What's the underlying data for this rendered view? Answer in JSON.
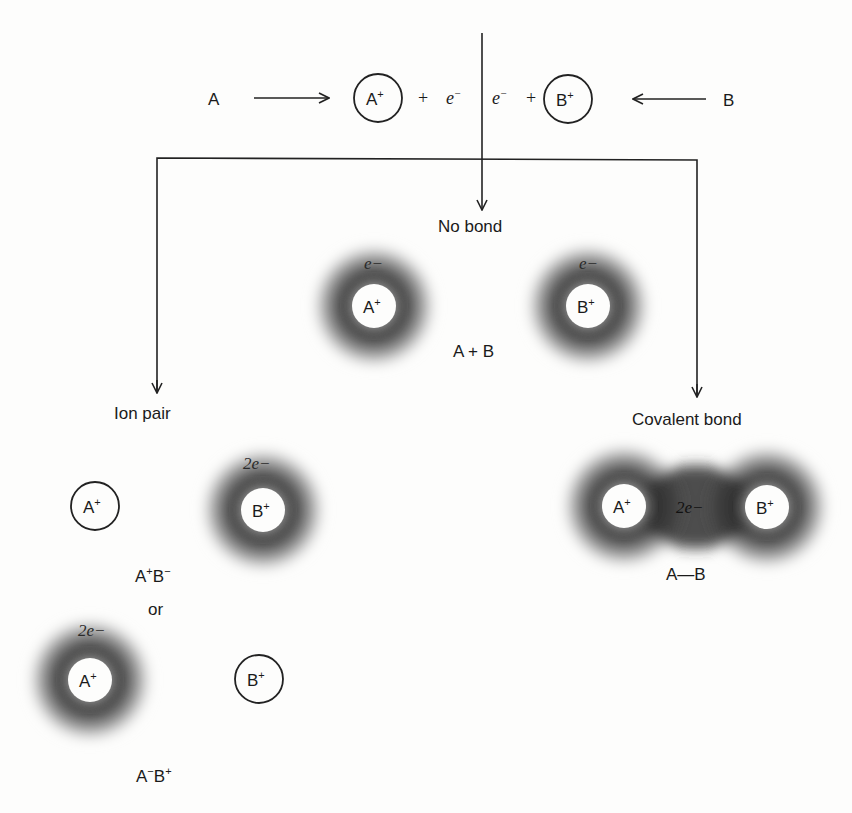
{
  "top": {
    "atom_a": "A",
    "atom_b": "B",
    "ion_a": "A",
    "ion_b": "B",
    "ion_charge": "+",
    "plus": "+",
    "electron": "e",
    "electron_charge": "−"
  },
  "branches": {
    "left": "Ion pair",
    "center": "No bond",
    "right": "Covalent bond"
  },
  "no_bond": {
    "cloud_a": {
      "ion": "A",
      "charge": "+",
      "electron_label": "e−"
    },
    "cloud_b": {
      "ion": "B",
      "charge": "+",
      "electron_label": "e−"
    },
    "formula": "A + B"
  },
  "ion_pair": {
    "case1": {
      "bare_ion": "A",
      "bare_charge": "+",
      "cloud_ion": "B",
      "cloud_charge": "+",
      "electron_label": "2e−",
      "formula_a": "A",
      "formula_a_charge": "+",
      "formula_b": "B",
      "formula_b_charge": "−"
    },
    "separator": "or",
    "case2": {
      "cloud_ion": "A",
      "cloud_charge": "+",
      "electron_label": "2e−",
      "bare_ion": "B",
      "bare_charge": "+",
      "formula_a": "A",
      "formula_a_charge": "−",
      "formula_b": "B",
      "formula_b_charge": "+"
    }
  },
  "covalent": {
    "ion_a": "A",
    "ion_b": "B",
    "charge": "+",
    "electron_label": "2e−",
    "formula": "A—B"
  },
  "colors": {
    "ink": "#1a1a1a",
    "cloud_dark": "#2e2e2e",
    "cloud_light": "#d8d8d8",
    "background": "#fdfdfc"
  }
}
